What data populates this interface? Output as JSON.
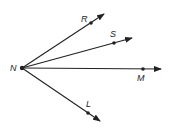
{
  "diagram": {
    "type": "rays-from-common-endpoint",
    "vertex": {
      "label": "N",
      "x": 22,
      "y": 68,
      "label_x": 10,
      "label_y": 71
    },
    "rays": [
      {
        "name": "NR",
        "point": {
          "label": "R",
          "x": 91,
          "y": 23,
          "label_x": 81,
          "label_y": 22
        },
        "tip": {
          "x": 104,
          "y": 14
        }
      },
      {
        "name": "NS",
        "point": {
          "label": "S",
          "x": 114,
          "y": 43,
          "label_x": 110,
          "label_y": 37
        },
        "tip": {
          "x": 132,
          "y": 38
        }
      },
      {
        "name": "NM",
        "point": {
          "label": "M",
          "x": 143,
          "y": 69,
          "label_x": 137,
          "label_y": 81
        },
        "tip": {
          "x": 161,
          "y": 69
        }
      },
      {
        "name": "NL",
        "point": {
          "label": "L",
          "x": 88,
          "y": 113,
          "label_x": 86,
          "label_y": 107
        },
        "tip": {
          "x": 100,
          "y": 121
        }
      }
    ],
    "colors": {
      "stroke": "#222222",
      "background": "#ffffff"
    }
  }
}
